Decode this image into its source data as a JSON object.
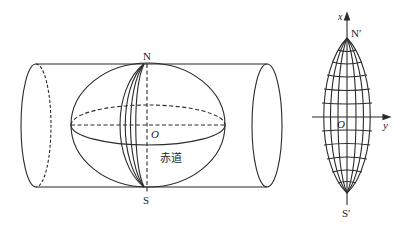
{
  "figure": {
    "left": {
      "title": "Transverse cylinder around globe",
      "labels": {
        "north": "N",
        "south": "S",
        "origin": "O",
        "equator": "赤道"
      }
    },
    "right": {
      "title": "Projected zone (lens-shaped graticule)",
      "labels": {
        "north": "N′",
        "south": "S′",
        "origin": "O",
        "x_axis": "x",
        "y_axis": "y"
      }
    },
    "colors": {
      "stroke": "#2a2a2a",
      "background": "#ffffff"
    }
  }
}
